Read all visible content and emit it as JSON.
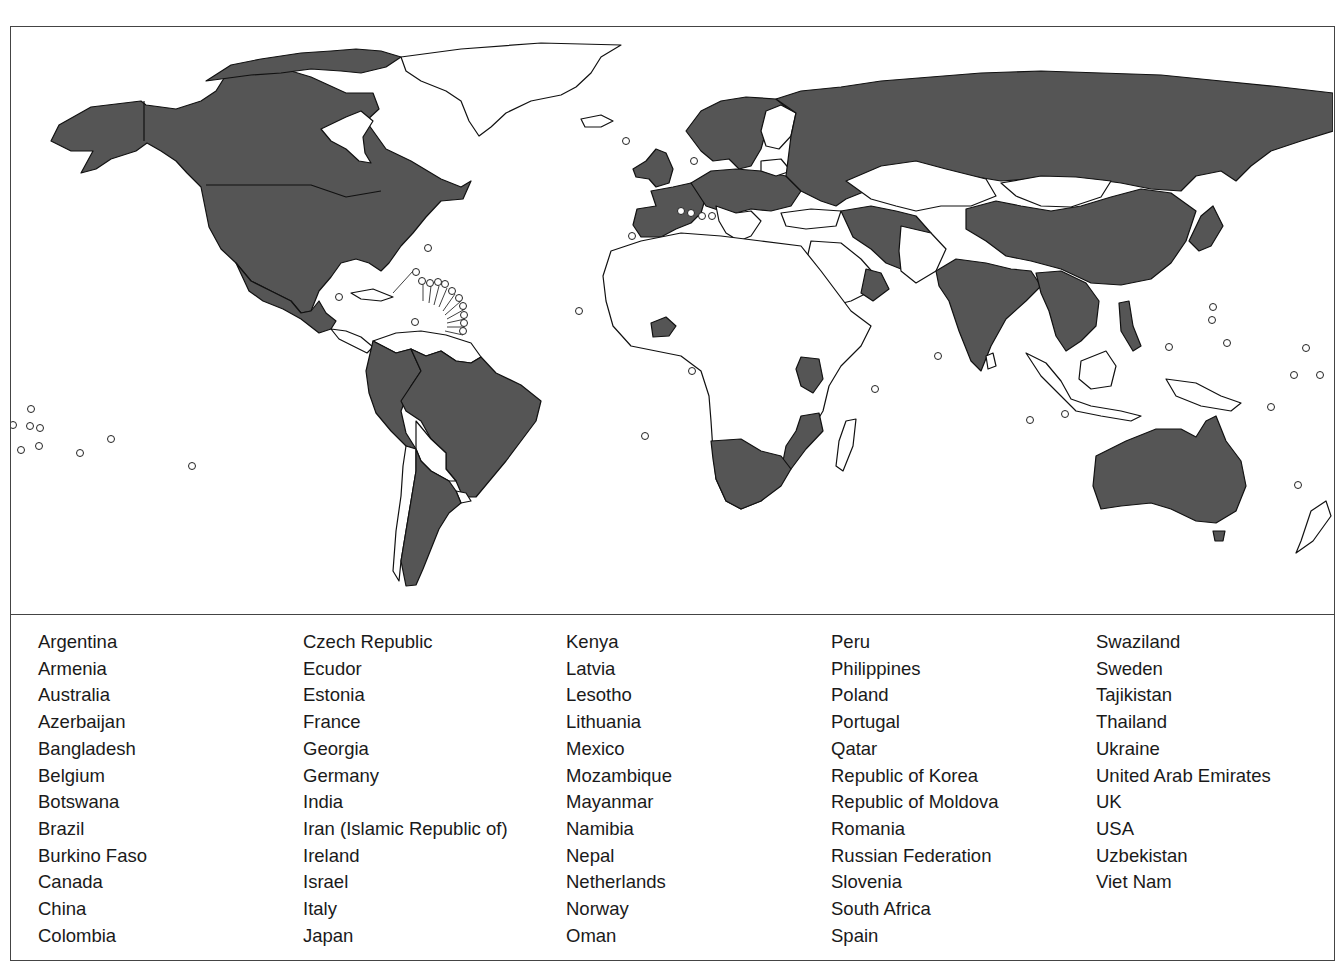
{
  "figure": {
    "type": "world-choropleth-map",
    "colors": {
      "highlighted_fill": "#555555",
      "default_fill": "#ffffff",
      "border": "#111111",
      "frame": "#444444"
    },
    "map_elements": {
      "highlighted": "dark grey fill marks listed countries",
      "small_state_markers": "hollow circles mark small island states"
    }
  },
  "legend": {
    "columns": [
      [
        "Argentina",
        "Armenia",
        "Australia",
        "Azerbaijan",
        "Bangladesh",
        "Belgium",
        "Botswana",
        "Brazil",
        "Burkino Faso",
        "Canada",
        "China",
        "Colombia"
      ],
      [
        "Czech Republic",
        "Ecudor",
        "Estonia",
        "France",
        "Georgia",
        "Germany",
        "India",
        "Iran (Islamic Republic of)",
        "Ireland",
        "Israel",
        "Italy",
        "Japan"
      ],
      [
        "Kenya",
        "Latvia",
        "Lesotho",
        "Lithuania",
        "Mexico",
        "Mozambique",
        "Mayanmar",
        "Namibia",
        "Nepal",
        "Netherlands",
        "Norway",
        "Oman"
      ],
      [
        "Peru",
        "Philippines",
        "Poland",
        "Portugal",
        "Qatar",
        "Republic of Korea",
        "Republic of Moldova",
        "Romania",
        "Russian Federation",
        "Slovenia",
        "South Africa",
        "Spain"
      ],
      [
        "Swaziland",
        "Sweden",
        "Tajikistan",
        "Thailand",
        "Ukraine",
        "United Arab Emirates",
        "UK",
        "USA",
        "Uzbekistan",
        "Viet Nam"
      ]
    ]
  }
}
